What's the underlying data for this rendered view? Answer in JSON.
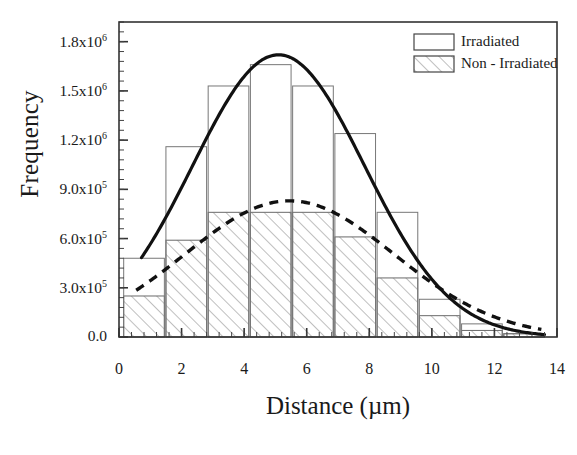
{
  "chart_data": {
    "type": "bar",
    "title": "",
    "xlabel": "Distance (µm)",
    "ylabel": "Frequency",
    "xlim": [
      0,
      14
    ],
    "ylim": [
      0,
      1920000
    ],
    "grid": false,
    "legend_position": "top-right",
    "xticks": [
      "0",
      "2",
      "4",
      "6",
      "8",
      "10",
      "12",
      "14"
    ],
    "xtick_values": [
      0,
      2,
      4,
      6,
      8,
      10,
      12,
      14
    ],
    "ytick_labels": [
      "0.0",
      "3.0x10⁵",
      "6.0x10⁵",
      "9.0x10⁵",
      "1.2x10⁶",
      "1.5x10⁶",
      "1.8x10⁶"
    ],
    "ytick_mantissa": [
      "0.0",
      "3.0x10",
      "6.0x10",
      "9.0x10",
      "1.2x10",
      "1.5x10",
      "1.8x10"
    ],
    "ytick_exponent": [
      "",
      "5",
      "5",
      "5",
      "6",
      "6",
      "6"
    ],
    "ytick_values": [
      0,
      300000,
      600000,
      900000,
      1200000,
      1500000,
      1800000
    ],
    "bin_centers": [
      0.8,
      2.15,
      3.5,
      4.85,
      6.2,
      7.55,
      8.9,
      10.25,
      11.6,
      12.95
    ],
    "bin_width": 1.3,
    "categories": [
      "0.8",
      "2.15",
      "3.5",
      "4.85",
      "6.2",
      "7.55",
      "8.9",
      "10.25",
      "11.6",
      "12.95"
    ],
    "series": [
      {
        "name": "Irradiated",
        "style": "open",
        "values": [
          480000,
          1160000,
          1530000,
          1660000,
          1530000,
          1240000,
          760000,
          230000,
          80000,
          20000
        ]
      },
      {
        "name": "Non - Irradiated",
        "style": "hatched",
        "values": [
          250000,
          590000,
          760000,
          760000,
          760000,
          610000,
          360000,
          130000,
          40000,
          20000
        ]
      }
    ],
    "fits": [
      {
        "name": "Irradiated fit",
        "line_style": "solid",
        "peak": 1720000,
        "mean": 5.1,
        "sigma": 2.75,
        "x_start": 0.72,
        "x_end": 13.6
      },
      {
        "name": "Non - Irradiated fit",
        "line_style": "dashed",
        "peak": 830000,
        "mean": 5.45,
        "sigma": 3.35,
        "x_start": 0.55,
        "x_end": 13.5
      }
    ]
  },
  "legend": {
    "items": [
      {
        "label": "Irradiated",
        "swatch": "open"
      },
      {
        "label": "Non - Irradiated",
        "swatch": "hatched"
      }
    ]
  },
  "axes": {
    "x_title": "Distance (µm)",
    "y_title": "Frequency"
  },
  "colors": {
    "line": "#111111",
    "bar_edge": "#555555",
    "hatch": "#9a9a9a",
    "frame": "#333333",
    "text": "#1a1a1a"
  }
}
